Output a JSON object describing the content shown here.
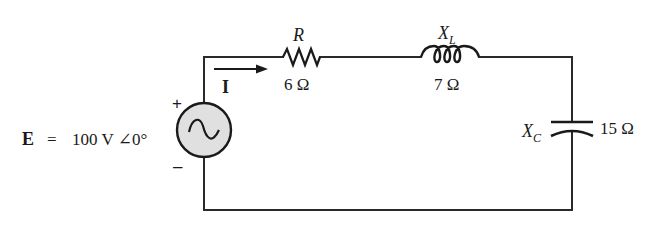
{
  "diagram": {
    "type": "series RLC circuit",
    "colors": {
      "wire": "#2a2a2a",
      "source_fill": "#e0e0e0",
      "text": "#1a1a1a",
      "background": "#ffffff"
    },
    "source": {
      "label_symbol": "E",
      "label_eq": "=",
      "label_value": "100 V ∠0°",
      "plus": "+",
      "minus": "–",
      "icon": "ac-sine-source-icon"
    },
    "current": {
      "label": "I",
      "icon": "arrow-right-icon"
    },
    "resistor": {
      "name": "R",
      "value": "6 Ω",
      "icon": "zigzag-resistor-icon"
    },
    "inductor": {
      "name_main": "X",
      "name_sub": "L",
      "value": "7 Ω",
      "icon": "coil-inductor-icon"
    },
    "capacitor": {
      "name_main": "X",
      "name_sub": "C",
      "value": "15 Ω",
      "icon": "capacitor-plates-icon"
    }
  }
}
